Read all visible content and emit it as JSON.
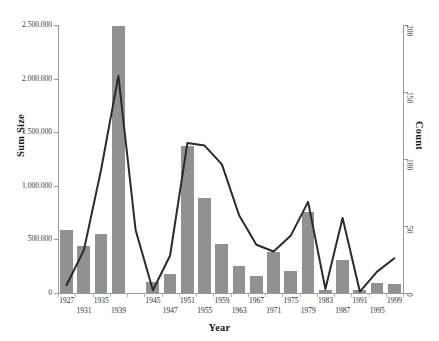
{
  "chart_data": {
    "type": "bar",
    "title": "",
    "xlabel": "Year",
    "ylabel": "Sum Size",
    "ylabel_secondary": "Count",
    "grid": false,
    "legend": "none",
    "categories": [
      "1927",
      "1931",
      "1935",
      "1939",
      "1943",
      "1945",
      "1947",
      "1951",
      "1955",
      "1959",
      "1963",
      "1967",
      "1971",
      "1975",
      "1979",
      "1983",
      "1987",
      "1991",
      "1995",
      "1999"
    ],
    "xtick_labels_row_a": [
      "1927",
      "1935",
      "1945",
      "1951",
      "1959",
      "1967",
      "1975",
      "1983",
      "1991",
      "1999"
    ],
    "xtick_labels_row_b": [
      "1931",
      "1939",
      "1947",
      "1955",
      "1963",
      "1971",
      "1979",
      "1987",
      "1995"
    ],
    "ylim": [
      0,
      2500000
    ],
    "ytick_labels": [
      "0",
      "500.000",
      "1.000.000",
      "1.500.000",
      "2.000.000",
      "2.500.000"
    ],
    "ytick_values": [
      0,
      500000,
      1000000,
      1500000,
      2000000,
      2500000
    ],
    "ylim_secondary": [
      0,
      200
    ],
    "ytick_labels_secondary": [
      "0",
      "50",
      "100",
      "150",
      "200"
    ],
    "ytick_values_secondary": [
      0,
      50,
      100,
      150,
      200
    ],
    "series": [
      {
        "name": "Sum Size",
        "axis": "left",
        "type": "bar",
        "color": "#919191",
        "values": [
          590000,
          440000,
          555000,
          2490000,
          0,
          105000,
          175000,
          1375000,
          890000,
          460000,
          250000,
          155000,
          385000,
          205000,
          755000,
          30000,
          310000,
          25000,
          95000,
          80000
        ]
      },
      {
        "name": "Count",
        "axis": "right",
        "type": "line",
        "color": "#2b2b2b",
        "values": [
          6,
          32,
          92,
          162,
          47,
          2,
          28,
          112,
          110,
          96,
          58,
          36,
          31,
          43,
          68,
          3,
          56,
          1,
          16,
          26
        ]
      }
    ]
  },
  "colors": {
    "bar": "#919191",
    "line": "#2b2b2b",
    "axis": "#9a9a9a",
    "text": "#1a1a1a",
    "background": "#ffffff"
  }
}
